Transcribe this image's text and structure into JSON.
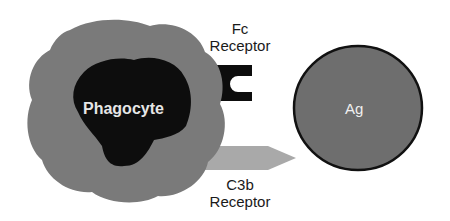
{
  "diagram": {
    "phagocyte": {
      "label": "Phagocyte",
      "cytoplasm_color": "#7a7a7a",
      "nucleus_color": "#0d0d0d",
      "label_color": "#e6e6e6"
    },
    "fc_receptor": {
      "line1": "Fc",
      "line2": "Receptor",
      "color": "#0d0d0d"
    },
    "c3b_receptor": {
      "line1": "C3b",
      "line2": "Receptor",
      "color": "#a9a9a9"
    },
    "antigen": {
      "label": "Ag",
      "fill_color": "#6e6e6e",
      "border_color": "#111111"
    }
  }
}
